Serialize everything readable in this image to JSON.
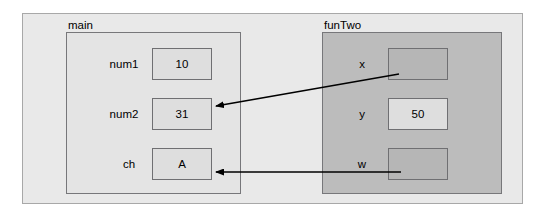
{
  "diagram": {
    "scopes": [
      {
        "id": "main",
        "name": "main",
        "fill": "#e4e4e4",
        "variables": [
          {
            "label": "num1",
            "value": "10",
            "empty": false
          },
          {
            "label": "num2",
            "value": "31",
            "empty": false
          },
          {
            "label": "ch",
            "value": "A",
            "empty": false
          }
        ]
      },
      {
        "id": "funTwo",
        "name": "funTwo",
        "fill": "#bcbcbc",
        "variables": [
          {
            "label": "x",
            "value": "",
            "empty": true
          },
          {
            "label": "y",
            "value": "50",
            "empty": false
          },
          {
            "label": "w",
            "value": "",
            "empty": true
          }
        ]
      }
    ],
    "arrows": [
      {
        "name": "x-to-num2",
        "from": "funTwo.x",
        "to": "main.num2",
        "style": "diagonal",
        "color": "#000000"
      },
      {
        "name": "w-to-ch",
        "from": "funTwo.w",
        "to": "main.ch",
        "style": "horizontal",
        "color": "#000000"
      }
    ],
    "colors": {
      "outer_frame_fill": "#e9e9e9",
      "outer_frame_border": "#a8a8a8",
      "box_border": "#6f6f72",
      "arrow": "#000000"
    }
  }
}
